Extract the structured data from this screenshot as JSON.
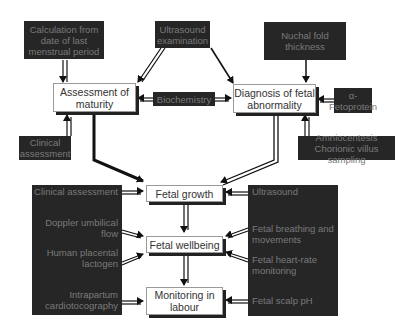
{
  "diagram": {
    "sources_top": {
      "lmp": "Calculation from date of last menstrual period",
      "ultrasound_exam": "Ultrasound examination",
      "nuchal": "Nuchal fold thickness"
    },
    "sources_middle": {
      "biochemistry": "Biochemistry",
      "afp": "α-Fetoprotein",
      "clinical": "Clinical assessment",
      "amnio": "Amniocentesis Chorionic villus sampling"
    },
    "nodes": {
      "maturity": "Assessment of maturity",
      "abnormality": "Diagnosis of fetal abnormality",
      "growth": "Fetal growth",
      "wellbeing": "Fetal wellbeing",
      "labour": "Monitoring in labour"
    },
    "left_panel": {
      "clinical": "Clinical assessment",
      "doppler": "Doppler umbilical flow",
      "hpl": "Human placental lactogen",
      "ctg": "Intrapartum cardiotocography"
    },
    "right_panel": {
      "ultrasound": "Ultrasound",
      "breathing": "Fetal breathing and movements",
      "heartrate": "Fetal heart-rate monitoring",
      "scalp": "Fetal scalp pH"
    }
  }
}
